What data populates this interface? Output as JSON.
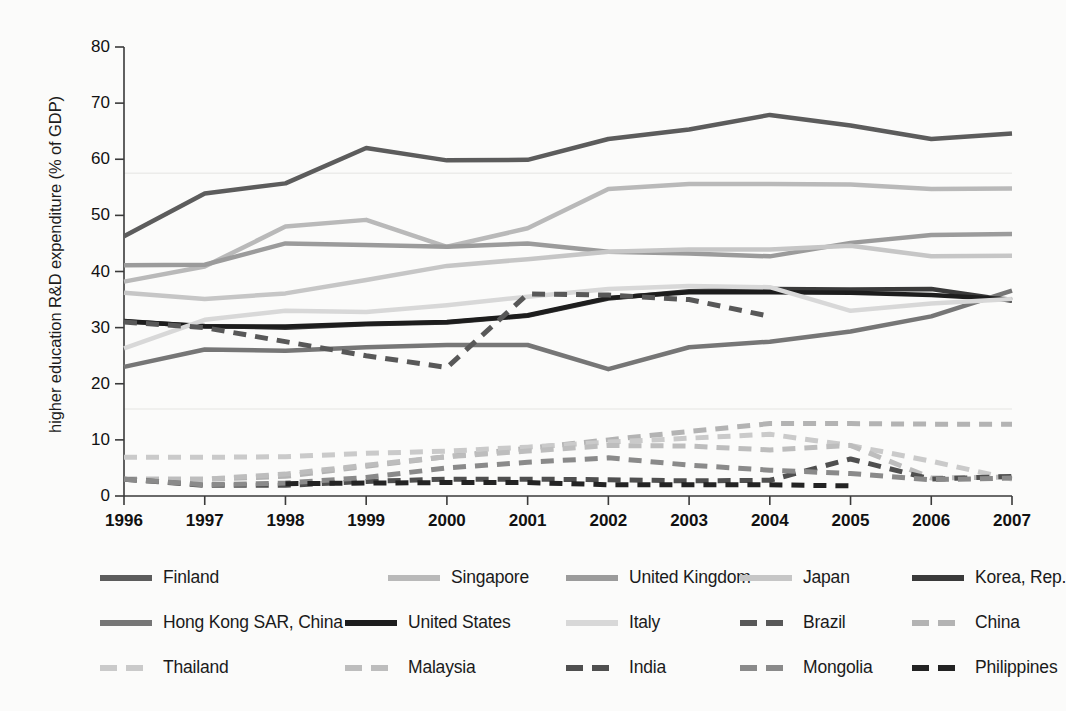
{
  "chart_data": {
    "type": "line",
    "title": "",
    "xlabel": "",
    "ylabel": "higher education R&D expenditure (% of GDP)",
    "categories": [
      "1996",
      "1997",
      "1998",
      "1999",
      "2000",
      "2001",
      "2002",
      "2003",
      "2004",
      "2005",
      "2006",
      "2007"
    ],
    "x": [
      1996,
      1997,
      1998,
      1999,
      2000,
      2001,
      2002,
      2003,
      2004,
      2005,
      2006,
      2007
    ],
    "xlim": [
      1996,
      2007
    ],
    "ylim": [
      0,
      80
    ],
    "yticks": [
      0,
      10,
      20,
      30,
      40,
      50,
      60,
      70,
      80
    ],
    "grid": false,
    "legend_position": "bottom",
    "series": [
      {
        "name": "Finland",
        "color": "#5c5c5c",
        "style": "solid",
        "width": 4.5,
        "values": [
          46.3,
          53.9,
          55.7,
          62.0,
          59.8,
          59.9,
          63.6,
          65.3,
          67.9,
          66.0,
          63.6,
          64.6
        ]
      },
      {
        "name": "Singapore",
        "color": "#b9b9b9",
        "style": "solid",
        "width": 4.5,
        "values": [
          38.2,
          40.9,
          48.0,
          49.2,
          44.4,
          47.7,
          54.7,
          55.6,
          55.6,
          55.5,
          54.7,
          54.8
        ]
      },
      {
        "name": "United Kingdom",
        "color": "#9b9b9b",
        "style": "solid",
        "width": 4.5,
        "values": [
          41.1,
          41.2,
          45.0,
          44.7,
          44.4,
          45.0,
          43.5,
          43.2,
          42.7,
          45.1,
          46.5,
          46.7
        ]
      },
      {
        "name": "Japan",
        "color": "#c6c6c6",
        "style": "solid",
        "width": 4.5,
        "values": [
          36.2,
          35.1,
          36.1,
          38.5,
          41.0,
          42.2,
          43.5,
          43.9,
          43.9,
          44.6,
          42.7,
          42.8
        ]
      },
      {
        "name": "Korea, Rep.",
        "color": "#3a3a3a",
        "style": "solid",
        "width": 4.5,
        "values": [
          31.1,
          30.3,
          30.0,
          30.6,
          30.9,
          32.1,
          35.2,
          36.5,
          36.9,
          36.8,
          36.9,
          34.8
        ]
      },
      {
        "name": "Hong Kong SAR, China",
        "color": "#767676",
        "style": "solid",
        "width": 4.5,
        "values": [
          23.0,
          26.1,
          25.9,
          26.5,
          26.9,
          26.9,
          22.6,
          26.5,
          27.5,
          29.3,
          32.0,
          36.6
        ]
      },
      {
        "name": "United States",
        "color": "#1d1d1d",
        "style": "solid",
        "width": 4.5,
        "values": [
          31.2,
          30.2,
          30.2,
          30.7,
          31.0,
          32.2,
          35.3,
          36.3,
          36.3,
          36.2,
          35.8,
          35.0
        ]
      },
      {
        "name": "Italy",
        "color": "#d8d8d8",
        "style": "solid",
        "width": 4.5,
        "values": [
          26.3,
          31.4,
          33.0,
          32.8,
          34.0,
          35.5,
          36.9,
          37.4,
          37.2,
          33.0,
          34.3,
          35.1
        ]
      },
      {
        "name": "Brazil",
        "color": "#585858",
        "style": "dashed",
        "width": 5.0,
        "values": [
          31.0,
          30.0,
          27.5,
          25.0,
          22.9,
          36.0,
          35.8,
          35.0,
          32.0,
          null,
          null,
          null
        ]
      },
      {
        "name": "China",
        "color": "#b3b3b3",
        "style": "dashed",
        "width": 5.0,
        "values": [
          3.0,
          3.0,
          3.5,
          5.3,
          7.0,
          8.5,
          10.0,
          11.5,
          12.9,
          12.9,
          12.8,
          12.8
        ]
      },
      {
        "name": "Thailand",
        "color": "#cacaca",
        "style": "dashed",
        "width": 5.0,
        "values": [
          6.9,
          6.9,
          7.0,
          7.6,
          8.0,
          8.7,
          9.6,
          10.3,
          11.0,
          9.0,
          6.2,
          3.0
        ]
      },
      {
        "name": "Malaysia",
        "color": "#bdbdbd",
        "style": "dashed",
        "width": 5.0,
        "values": [
          3.0,
          3.0,
          3.9,
          5.5,
          7.0,
          8.0,
          9.0,
          8.9,
          8.2,
          9.0,
          3.2,
          3.4
        ]
      },
      {
        "name": "India",
        "color": "#4f4f4f",
        "style": "dashed",
        "width": 5.0,
        "values": [
          3.0,
          1.9,
          1.9,
          2.6,
          3.0,
          3.0,
          2.9,
          2.7,
          2.8,
          6.6,
          3.0,
          3.5
        ]
      },
      {
        "name": "Mongolia",
        "color": "#8a8a8a",
        "style": "dashed",
        "width": 5.0,
        "values": [
          3.0,
          2.0,
          2.3,
          3.3,
          5.0,
          6.0,
          6.8,
          5.5,
          4.6,
          4.0,
          2.9,
          3.2
        ]
      },
      {
        "name": "Philippines",
        "color": "#232323",
        "style": "dashed",
        "width": 5.0,
        "values": [
          null,
          null,
          2.2,
          2.3,
          2.4,
          2.4,
          2.0,
          2.0,
          2.0,
          1.8,
          null,
          null
        ]
      }
    ]
  },
  "axes": {
    "y_tick_labels": [
      "80",
      "70",
      "60",
      "50",
      "40",
      "30",
      "20",
      "10",
      "0"
    ],
    "x_tick_labels": [
      "1996",
      "1997",
      "1998",
      "1999",
      "2000",
      "2001",
      "2002",
      "2003",
      "2004",
      "2005",
      "2006",
      "2007"
    ],
    "y_axis_title": "higher education R&D expenditure (% of GDP)"
  },
  "legend": {
    "rows": [
      [
        {
          "label": "Finland",
          "color": "#5c5c5c",
          "style": "solid"
        },
        {
          "label": "Singapore",
          "color": "#b9b9b9",
          "style": "solid"
        },
        {
          "label": "United Kingdom",
          "color": "#9b9b9b",
          "style": "solid"
        },
        {
          "label": "Japan",
          "color": "#c6c6c6",
          "style": "solid"
        },
        {
          "label": "Korea, Rep.",
          "color": "#3a3a3a",
          "style": "solid"
        }
      ],
      [
        {
          "label": "Hong Kong SAR, China",
          "color": "#767676",
          "style": "solid"
        },
        {
          "label": "United States",
          "color": "#1d1d1d",
          "style": "solid"
        },
        {
          "label": "Italy",
          "color": "#d8d8d8",
          "style": "solid"
        },
        {
          "label": "Brazil",
          "color": "#585858",
          "style": "dashed"
        },
        {
          "label": "China",
          "color": "#b3b3b3",
          "style": "dashed"
        }
      ],
      [
        {
          "label": "Thailand",
          "color": "#cacaca",
          "style": "dashed"
        },
        {
          "label": "Malaysia",
          "color": "#bdbdbd",
          "style": "dashed"
        },
        {
          "label": "India",
          "color": "#4f4f4f",
          "style": "dashed"
        },
        {
          "label": "Mongolia",
          "color": "#8a8a8a",
          "style": "dashed"
        },
        {
          "label": "Philippines",
          "color": "#232323",
          "style": "dashed"
        }
      ]
    ]
  }
}
